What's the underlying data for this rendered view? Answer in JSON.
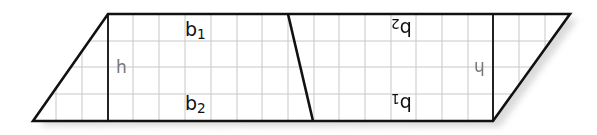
{
  "figure": {
    "colors": {
      "background": "#ffffff",
      "grid": "#c8c8c8",
      "outline": "#111111",
      "height_label": "#777777",
      "shadow": "#bdbdbd"
    },
    "grid": {
      "cell_px": 25.7,
      "rows": 4
    },
    "left_trapezoid": {
      "top_label": "b",
      "top_sub": "1",
      "bottom_label": "b",
      "bottom_sub": "2",
      "height_label": "h"
    },
    "right_trapezoid_rotated": {
      "top_label": "b",
      "top_sub": "2",
      "bottom_label": "b",
      "bottom_sub": "1",
      "height_label": "h"
    }
  }
}
